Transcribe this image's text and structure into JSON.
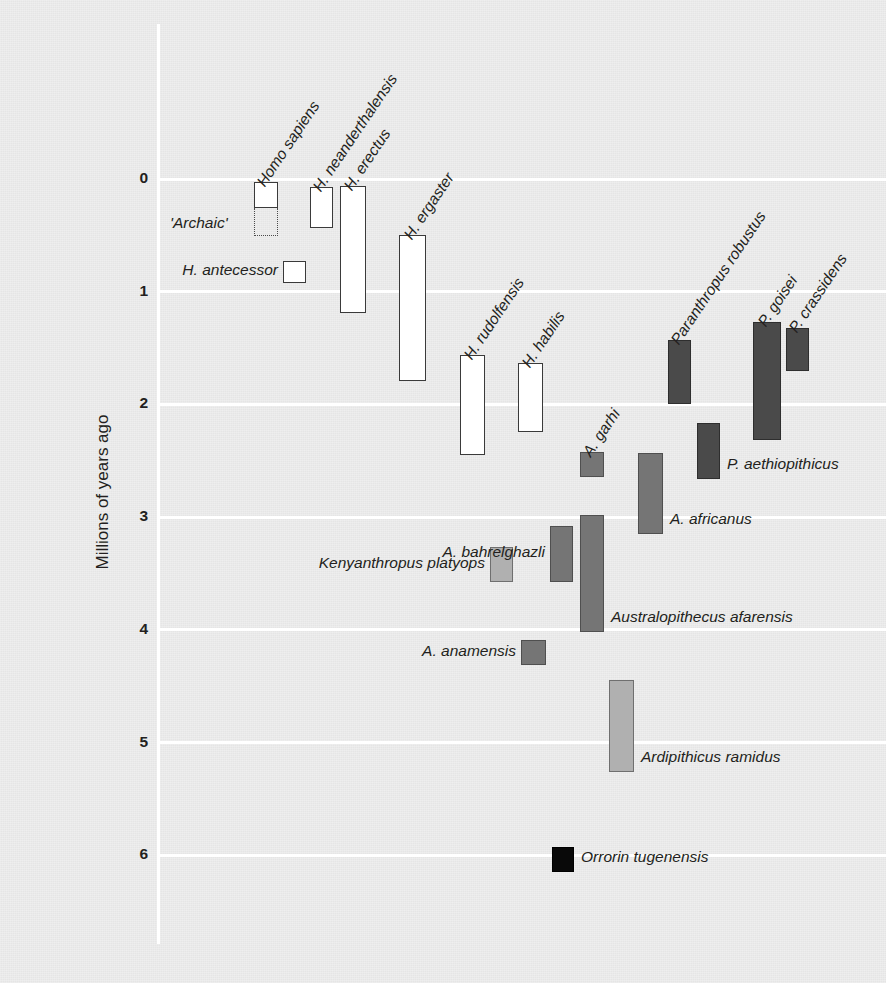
{
  "chart_data": {
    "type": "bar",
    "orientation": "vertical-ranges",
    "title": "",
    "subtitle": "",
    "xlabel": "",
    "ylabel": "Millions of years ago",
    "ylim": [
      0,
      6.6
    ],
    "y_inverted": true,
    "grid": true,
    "legend": "none",
    "ytick_labels": [
      "0",
      "1",
      "2",
      "3",
      "4",
      "5",
      "6"
    ],
    "yticks": [
      0,
      1,
      2,
      3,
      4,
      5,
      6
    ],
    "colors": {
      "background": "#ebebeb",
      "gridline": "#ffffff",
      "hollow_fill": "#ffffff",
      "outline": "#3a3a3a",
      "dark_gray": "#4a4a4a",
      "mid_gray": "#757575",
      "light_gray": "#b0b0b0",
      "black": "#090909",
      "text": "#231f20"
    },
    "taxa": [
      {
        "name": "Homo sapiens",
        "range_start": 0.03,
        "range_end": 0.26,
        "fill": "hollow",
        "label_style": "rotated",
        "sub_range": {
          "name": "'Archaic'",
          "range_start": 0.26,
          "range_end": 0.5,
          "fill": "dotted",
          "label_style": "left"
        }
      },
      {
        "name": "H. neanderthalensis",
        "range_start": 0.07,
        "range_end": 0.43,
        "fill": "hollow",
        "label_style": "rotated"
      },
      {
        "name": "H. erectus",
        "range_start": 0.06,
        "range_end": 1.18,
        "fill": "hollow",
        "label_style": "rotated"
      },
      {
        "name": "H. antecessor",
        "range_start": 0.72,
        "range_end": 0.92,
        "fill": "hollow",
        "label_style": "left"
      },
      {
        "name": "H. ergaster",
        "range_start": 0.5,
        "range_end": 1.79,
        "fill": "hollow",
        "label_style": "rotated"
      },
      {
        "name": "H. rudolfensis",
        "range_start": 1.56,
        "range_end": 2.45,
        "fill": "hollow",
        "label_style": "rotated"
      },
      {
        "name": "H. habilis",
        "range_start": 1.63,
        "range_end": 2.24,
        "fill": "hollow",
        "label_style": "rotated"
      },
      {
        "name": "A. garhi",
        "range_start": 2.42,
        "range_end": 2.64,
        "fill": "mid",
        "label_style": "rotated"
      },
      {
        "name": "A. africanus",
        "range_start": 2.43,
        "range_end": 3.15,
        "fill": "mid",
        "label_style": "right"
      },
      {
        "name": "Paranthropus robustus",
        "range_start": 1.43,
        "range_end": 2.0,
        "fill": "dark",
        "label_style": "rotated"
      },
      {
        "name": "P. aethiopithicus",
        "range_start": 2.17,
        "range_end": 2.66,
        "fill": "dark",
        "label_style": "right"
      },
      {
        "name": "P. goisei",
        "range_start": 1.27,
        "range_end": 2.32,
        "fill": "dark",
        "label_style": "rotated"
      },
      {
        "name": "P. crassidens",
        "range_start": 1.32,
        "range_end": 1.7,
        "fill": "dark",
        "label_style": "rotated"
      },
      {
        "name": "Kenyanthropus platyops",
        "range_start": 3.27,
        "range_end": 3.58,
        "fill": "light",
        "label_style": "left"
      },
      {
        "name": "A. bahrelghazli",
        "range_start": 3.08,
        "range_end": 3.58,
        "fill": "mid",
        "label_style": "left"
      },
      {
        "name": "Australopithecus  afarensis",
        "range_start": 2.98,
        "range_end": 4.02,
        "fill": "mid",
        "label_style": "right"
      },
      {
        "name": "A. anamensis",
        "range_start": 4.09,
        "range_end": 4.31,
        "fill": "mid",
        "label_style": "left"
      },
      {
        "name": "Ardipithicus ramidus",
        "range_start": 4.45,
        "range_end": 5.26,
        "fill": "light",
        "label_style": "right"
      },
      {
        "name": "Orrorin tugenensis",
        "range_start": 5.93,
        "range_end": 6.15,
        "fill": "black",
        "label_style": "right"
      }
    ]
  },
  "geometry": {
    "y0_px": 179,
    "px_per_my": 112.7,
    "bars": [
      {
        "x": 254,
        "w": 24,
        "top": 182,
        "bottom": 208,
        "sub_top": 208,
        "sub_bottom": 236
      },
      {
        "x": 310,
        "w": 23,
        "top": 187,
        "bottom": 228
      },
      {
        "x": 340,
        "w": 26,
        "top": 186,
        "bottom": 313
      },
      {
        "x": 283,
        "w": 23,
        "top": 261,
        "bottom": 283
      },
      {
        "x": 399,
        "w": 27,
        "top": 235,
        "bottom": 381
      },
      {
        "x": 460,
        "w": 25,
        "top": 355,
        "bottom": 455
      },
      {
        "x": 518,
        "w": 25,
        "top": 363,
        "bottom": 432
      },
      {
        "x": 580,
        "w": 24,
        "top": 452,
        "bottom": 477
      },
      {
        "x": 638,
        "w": 25,
        "top": 453,
        "bottom": 534
      },
      {
        "x": 668,
        "w": 23,
        "top": 340,
        "bottom": 404
      },
      {
        "x": 697,
        "w": 23,
        "top": 423,
        "bottom": 479
      },
      {
        "x": 753,
        "w": 28,
        "top": 322,
        "bottom": 440
      },
      {
        "x": 786,
        "w": 23,
        "top": 328,
        "bottom": 371
      },
      {
        "x": 490,
        "w": 23,
        "top": 547,
        "bottom": 582
      },
      {
        "x": 550,
        "w": 23,
        "top": 526,
        "bottom": 582
      },
      {
        "x": 580,
        "w": 24,
        "top": 515,
        "bottom": 632
      },
      {
        "x": 521,
        "w": 25,
        "top": 640,
        "bottom": 665
      },
      {
        "x": 609,
        "w": 25,
        "top": 680,
        "bottom": 772
      },
      {
        "x": 552,
        "w": 22,
        "top": 847,
        "bottom": 872
      }
    ]
  }
}
